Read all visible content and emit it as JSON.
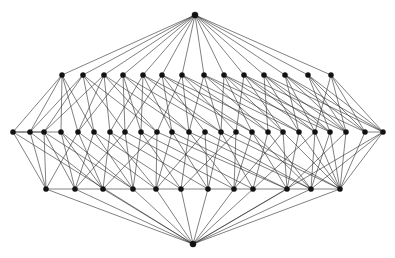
{
  "figure": {
    "kind": "graph-drawing",
    "background_color": "#ffffff",
    "edge_color": "#2b2b2b",
    "node_color": "#121212",
    "node_radius": 2.6,
    "apex_radius": 3.1,
    "edge_width": 0.65,
    "width": 395,
    "height": 258
  },
  "graph_data": {
    "type": "node-link-diagram",
    "layout": "layered",
    "node_count": 52,
    "edge_count": 168,
    "layers": [
      {
        "name": "top-apex",
        "y": 15,
        "count": 1
      },
      {
        "name": "upper-row",
        "y": 75,
        "count": 14
      },
      {
        "name": "middle-row",
        "y": 132,
        "count": 24
      },
      {
        "name": "lower-row",
        "y": 189,
        "count": 12
      },
      {
        "name": "bottom-apex",
        "y": 244,
        "count": 1
      }
    ],
    "nodes": [
      {
        "id": 0,
        "x": 195,
        "y": 15,
        "layer": 0
      },
      {
        "id": 1,
        "x": 62,
        "y": 75,
        "layer": 1
      },
      {
        "id": 2,
        "x": 83,
        "y": 75,
        "layer": 1
      },
      {
        "id": 3,
        "x": 104,
        "y": 75,
        "layer": 1
      },
      {
        "id": 4,
        "x": 123,
        "y": 75,
        "layer": 1
      },
      {
        "id": 5,
        "x": 143,
        "y": 75,
        "layer": 1
      },
      {
        "id": 6,
        "x": 162,
        "y": 75,
        "layer": 1
      },
      {
        "id": 7,
        "x": 182,
        "y": 75,
        "layer": 1
      },
      {
        "id": 8,
        "x": 204,
        "y": 75,
        "layer": 1
      },
      {
        "id": 9,
        "x": 224,
        "y": 75,
        "layer": 1
      },
      {
        "id": 10,
        "x": 244,
        "y": 75,
        "layer": 1
      },
      {
        "id": 11,
        "x": 264,
        "y": 75,
        "layer": 1
      },
      {
        "id": 12,
        "x": 285,
        "y": 75,
        "layer": 1
      },
      {
        "id": 13,
        "x": 308,
        "y": 75,
        "layer": 1
      },
      {
        "id": 14,
        "x": 331,
        "y": 75,
        "layer": 1
      },
      {
        "id": 15,
        "x": 13,
        "y": 132,
        "layer": 2
      },
      {
        "id": 16,
        "x": 30,
        "y": 132,
        "layer": 2
      },
      {
        "id": 17,
        "x": 44,
        "y": 132,
        "layer": 2
      },
      {
        "id": 18,
        "x": 61,
        "y": 132,
        "layer": 2
      },
      {
        "id": 19,
        "x": 78,
        "y": 132,
        "layer": 2
      },
      {
        "id": 20,
        "x": 94,
        "y": 132,
        "layer": 2
      },
      {
        "id": 21,
        "x": 110,
        "y": 132,
        "layer": 2
      },
      {
        "id": 22,
        "x": 125,
        "y": 132,
        "layer": 2
      },
      {
        "id": 23,
        "x": 141,
        "y": 132,
        "layer": 2
      },
      {
        "id": 24,
        "x": 157,
        "y": 132,
        "layer": 2
      },
      {
        "id": 25,
        "x": 172,
        "y": 132,
        "layer": 2
      },
      {
        "id": 26,
        "x": 189,
        "y": 132,
        "layer": 2
      },
      {
        "id": 27,
        "x": 205,
        "y": 132,
        "layer": 2
      },
      {
        "id": 28,
        "x": 221,
        "y": 132,
        "layer": 2
      },
      {
        "id": 29,
        "x": 236,
        "y": 132,
        "layer": 2
      },
      {
        "id": 30,
        "x": 252,
        "y": 132,
        "layer": 2
      },
      {
        "id": 31,
        "x": 268,
        "y": 132,
        "layer": 2
      },
      {
        "id": 32,
        "x": 283,
        "y": 132,
        "layer": 2
      },
      {
        "id": 33,
        "x": 299,
        "y": 132,
        "layer": 2
      },
      {
        "id": 34,
        "x": 315,
        "y": 132,
        "layer": 2
      },
      {
        "id": 35,
        "x": 330,
        "y": 132,
        "layer": 2
      },
      {
        "id": 36,
        "x": 346,
        "y": 132,
        "layer": 2
      },
      {
        "id": 37,
        "x": 365,
        "y": 132,
        "layer": 2
      },
      {
        "id": 38,
        "x": 383,
        "y": 132,
        "layer": 2
      },
      {
        "id": 39,
        "x": 46,
        "y": 189,
        "layer": 3
      },
      {
        "id": 40,
        "x": 75,
        "y": 189,
        "layer": 3
      },
      {
        "id": 41,
        "x": 103,
        "y": 189,
        "layer": 3
      },
      {
        "id": 42,
        "x": 133,
        "y": 189,
        "layer": 3
      },
      {
        "id": 43,
        "x": 156,
        "y": 189,
        "layer": 3
      },
      {
        "id": 44,
        "x": 181,
        "y": 189,
        "layer": 3
      },
      {
        "id": 45,
        "x": 208,
        "y": 189,
        "layer": 3
      },
      {
        "id": 46,
        "x": 234,
        "y": 189,
        "layer": 3
      },
      {
        "id": 47,
        "x": 253,
        "y": 189,
        "layer": 3
      },
      {
        "id": 48,
        "x": 287,
        "y": 189,
        "layer": 3
      },
      {
        "id": 49,
        "x": 311,
        "y": 189,
        "layer": 3
      },
      {
        "id": 50,
        "x": 340,
        "y": 189,
        "layer": 3
      },
      {
        "id": 51,
        "x": 193,
        "y": 244,
        "layer": 4
      }
    ],
    "edges": [
      [
        0,
        1
      ],
      [
        0,
        2
      ],
      [
        0,
        3
      ],
      [
        0,
        4
      ],
      [
        0,
        5
      ],
      [
        0,
        6
      ],
      [
        0,
        7
      ],
      [
        0,
        8
      ],
      [
        0,
        9
      ],
      [
        0,
        10
      ],
      [
        0,
        11
      ],
      [
        0,
        12
      ],
      [
        0,
        13
      ],
      [
        0,
        14
      ],
      [
        1,
        15
      ],
      [
        1,
        16
      ],
      [
        1,
        18
      ],
      [
        1,
        19
      ],
      [
        2,
        16
      ],
      [
        2,
        17
      ],
      [
        2,
        20
      ],
      [
        2,
        22
      ],
      [
        3,
        17
      ],
      [
        3,
        19
      ],
      [
        3,
        21
      ],
      [
        3,
        24
      ],
      [
        4,
        19
      ],
      [
        4,
        22
      ],
      [
        4,
        23
      ],
      [
        4,
        26
      ],
      [
        5,
        21
      ],
      [
        5,
        23
      ],
      [
        5,
        25
      ],
      [
        5,
        28
      ],
      [
        6,
        22
      ],
      [
        6,
        25
      ],
      [
        6,
        27
      ],
      [
        6,
        30
      ],
      [
        7,
        24
      ],
      [
        7,
        26
      ],
      [
        7,
        29
      ],
      [
        7,
        31
      ],
      [
        8,
        26
      ],
      [
        8,
        28
      ],
      [
        8,
        31
      ],
      [
        8,
        33
      ],
      [
        9,
        28
      ],
      [
        9,
        30
      ],
      [
        9,
        32
      ],
      [
        9,
        34
      ],
      [
        10,
        29
      ],
      [
        10,
        32
      ],
      [
        10,
        34
      ],
      [
        10,
        35
      ],
      [
        11,
        31
      ],
      [
        11,
        33
      ],
      [
        11,
        35
      ],
      [
        11,
        36
      ],
      [
        12,
        33
      ],
      [
        12,
        34
      ],
      [
        12,
        36
      ],
      [
        12,
        37
      ],
      [
        13,
        35
      ],
      [
        13,
        36
      ],
      [
        13,
        37
      ],
      [
        13,
        38
      ],
      [
        14,
        36
      ],
      [
        14,
        37
      ],
      [
        14,
        38
      ],
      [
        14,
        34
      ],
      [
        15,
        16
      ],
      [
        15,
        39
      ],
      [
        15,
        17
      ],
      [
        16,
        39
      ],
      [
        16,
        18
      ],
      [
        17,
        39
      ],
      [
        17,
        40
      ],
      [
        18,
        40
      ],
      [
        18,
        41
      ],
      [
        19,
        39
      ],
      [
        19,
        41
      ],
      [
        20,
        40
      ],
      [
        20,
        42
      ],
      [
        21,
        41
      ],
      [
        21,
        43
      ],
      [
        22,
        40
      ],
      [
        22,
        42
      ],
      [
        23,
        42
      ],
      [
        23,
        44
      ],
      [
        24,
        41
      ],
      [
        24,
        43
      ],
      [
        25,
        43
      ],
      [
        25,
        45
      ],
      [
        26,
        44
      ],
      [
        26,
        46
      ],
      [
        27,
        43
      ],
      [
        27,
        45
      ],
      [
        28,
        45
      ],
      [
        28,
        47
      ],
      [
        29,
        44
      ],
      [
        29,
        46
      ],
      [
        30,
        46
      ],
      [
        30,
        48
      ],
      [
        31,
        47
      ],
      [
        31,
        49
      ],
      [
        32,
        46
      ],
      [
        32,
        48
      ],
      [
        33,
        48
      ],
      [
        33,
        50
      ],
      [
        34,
        47
      ],
      [
        34,
        49
      ],
      [
        35,
        49
      ],
      [
        35,
        50
      ],
      [
        36,
        48
      ],
      [
        36,
        50
      ],
      [
        37,
        50
      ],
      [
        37,
        38
      ],
      [
        38,
        50
      ],
      [
        38,
        49
      ],
      [
        39,
        51
      ],
      [
        40,
        51
      ],
      [
        41,
        51
      ],
      [
        42,
        51
      ],
      [
        43,
        51
      ],
      [
        44,
        51
      ],
      [
        45,
        51
      ],
      [
        46,
        51
      ],
      [
        47,
        51
      ],
      [
        48,
        51
      ],
      [
        49,
        51
      ],
      [
        50,
        51
      ],
      [
        15,
        51
      ],
      [
        38,
        51
      ],
      [
        1,
        20
      ],
      [
        2,
        24
      ],
      [
        3,
        26
      ],
      [
        4,
        28
      ],
      [
        5,
        30
      ],
      [
        6,
        32
      ],
      [
        7,
        33
      ],
      [
        8,
        35
      ],
      [
        9,
        36
      ],
      [
        10,
        37
      ],
      [
        11,
        38
      ],
      [
        12,
        38
      ],
      [
        19,
        43
      ],
      [
        21,
        45
      ],
      [
        23,
        47
      ],
      [
        25,
        48
      ],
      [
        27,
        49
      ],
      [
        29,
        50
      ],
      [
        18,
        42
      ],
      [
        20,
        44
      ],
      [
        22,
        46
      ],
      [
        24,
        48
      ],
      [
        26,
        49
      ],
      [
        28,
        50
      ],
      [
        16,
        41
      ],
      [
        17,
        42
      ],
      [
        30,
        49
      ],
      [
        32,
        50
      ],
      [
        34,
        50
      ],
      [
        39,
        40
      ],
      [
        40,
        41
      ],
      [
        41,
        42
      ],
      [
        42,
        43
      ],
      [
        43,
        44
      ],
      [
        44,
        45
      ],
      [
        45,
        46
      ],
      [
        46,
        47
      ],
      [
        47,
        48
      ],
      [
        48,
        49
      ],
      [
        49,
        50
      ]
    ]
  }
}
